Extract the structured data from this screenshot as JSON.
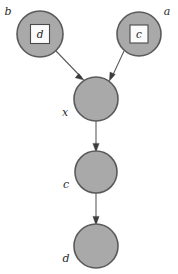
{
  "diagram": {
    "colors": {
      "node_fill": "#a9a9a9",
      "node_stroke": "#5a5a5a",
      "inner_box_fill": "#fbfbfb",
      "inner_box_stroke": "#4a4a4a",
      "edge": "#5c5c5c",
      "arrow": "#3c3c3c",
      "label": "#2b2b2b",
      "background": "#ffffff"
    },
    "nodes": [
      {
        "id": "node-b",
        "outer_label": "b",
        "inner_label": "d",
        "has_inner_box": true,
        "cx": 40,
        "cy": 34,
        "r": 23,
        "label_x": 8,
        "label_y": 15,
        "box_size": 19
      },
      {
        "id": "node-a",
        "outer_label": "a",
        "inner_label": "c",
        "has_inner_box": true,
        "cx": 139,
        "cy": 34,
        "r": 22,
        "label_x": 166,
        "label_y": 15,
        "box_size": 18
      },
      {
        "id": "node-x",
        "outer_label": "x",
        "inner_label": "",
        "has_inner_box": false,
        "cx": 96,
        "cy": 99,
        "r": 22,
        "label_x": 63,
        "label_y": 115,
        "box_size": 0
      },
      {
        "id": "node-c",
        "outer_label": "c",
        "inner_label": "",
        "has_inner_box": false,
        "cx": 96,
        "cy": 172,
        "r": 21,
        "label_x": 64,
        "label_y": 188,
        "box_size": 0
      },
      {
        "id": "node-d",
        "outer_label": "d",
        "inner_label": "",
        "has_inner_box": false,
        "cx": 96,
        "cy": 246,
        "r": 22,
        "label_x": 64,
        "label_y": 262,
        "box_size": 0
      }
    ],
    "edges": [
      {
        "id": "edge-b-to-x",
        "from": "node-b",
        "to": "node-x",
        "x1": 56,
        "y1": 51,
        "x2": 83,
        "y2": 79
      },
      {
        "id": "edge-a-to-x",
        "from": "node-a",
        "to": "node-x",
        "x1": 124,
        "y1": 51,
        "x2": 110,
        "y2": 80
      },
      {
        "id": "edge-x-to-c",
        "from": "node-x",
        "to": "node-c",
        "x1": 96,
        "y1": 121,
        "x2": 96,
        "y2": 150
      },
      {
        "id": "edge-c-to-d",
        "from": "node-c",
        "to": "node-d",
        "x1": 96,
        "y1": 193,
        "x2": 96,
        "y2": 223
      }
    ]
  }
}
